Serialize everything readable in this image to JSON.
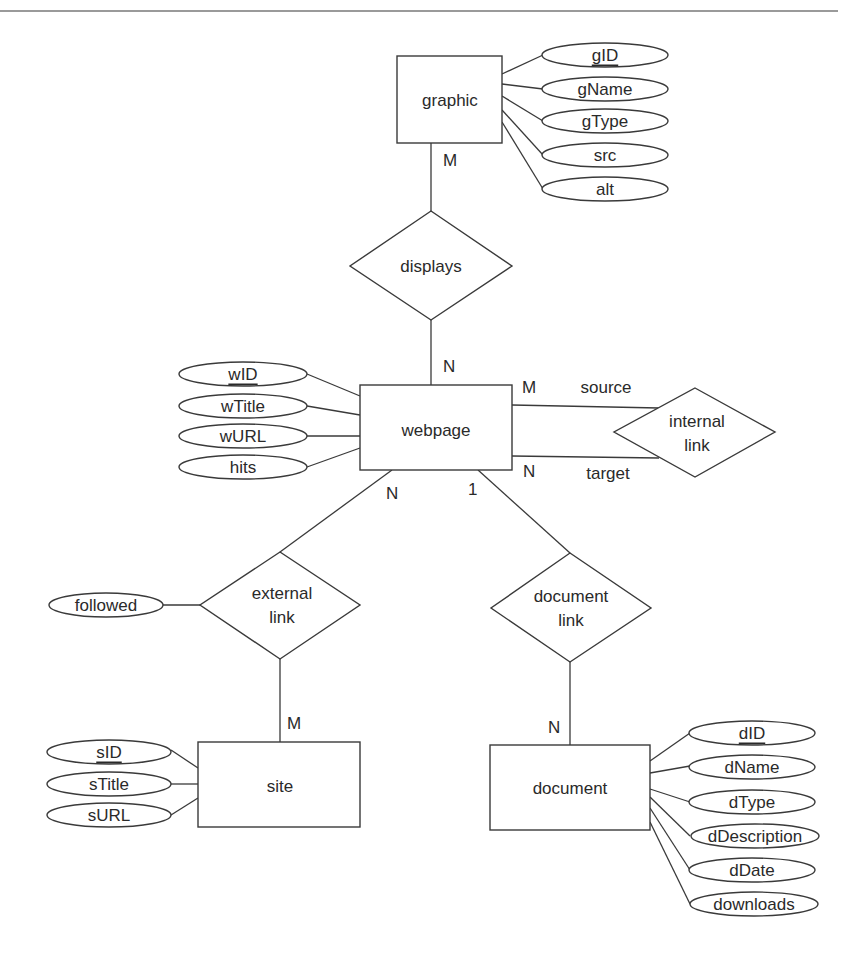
{
  "diagram": {
    "type": "entity-relationship",
    "entities": {
      "graphic": {
        "label": "graphic",
        "attributes": [
          {
            "name": "gID",
            "key": true
          },
          {
            "name": "gName",
            "key": false
          },
          {
            "name": "gType",
            "key": false
          },
          {
            "name": "src",
            "key": false
          },
          {
            "name": "alt",
            "key": false
          }
        ]
      },
      "webpage": {
        "label": "webpage",
        "attributes": [
          {
            "name": "wID",
            "key": true
          },
          {
            "name": "wTitle",
            "key": false
          },
          {
            "name": "wURL",
            "key": false
          },
          {
            "name": "hits",
            "key": false
          }
        ]
      },
      "site": {
        "label": "site",
        "attributes": [
          {
            "name": "sID",
            "key": true
          },
          {
            "name": "sTitle",
            "key": false
          },
          {
            "name": "sURL",
            "key": false
          }
        ]
      },
      "document": {
        "label": "document",
        "attributes": [
          {
            "name": "dID",
            "key": true
          },
          {
            "name": "dName",
            "key": false
          },
          {
            "name": "dType",
            "key": false
          },
          {
            "name": "dDescription",
            "key": false
          },
          {
            "name": "dDate",
            "key": false
          },
          {
            "name": "downloads",
            "key": false
          }
        ]
      }
    },
    "relationships": {
      "displays": {
        "label": "displays",
        "cardinality": {
          "graphic": "M",
          "webpage": "N"
        }
      },
      "internal_link": {
        "label_line1": "internal",
        "label_line2": "link",
        "roles": {
          "source": "source",
          "target": "target"
        },
        "cardinality": {
          "source": "M",
          "target": "N"
        }
      },
      "external_link": {
        "label_line1": "external",
        "label_line2": "link",
        "attributes": [
          {
            "name": "followed",
            "key": false
          }
        ],
        "cardinality": {
          "webpage": "N",
          "site": "M"
        }
      },
      "document_link": {
        "label_line1": "document",
        "label_line2": "link",
        "cardinality": {
          "webpage": "1",
          "document": "N"
        }
      }
    }
  },
  "colors": {
    "stroke": "#3a3a3a",
    "text": "#2a2a2a",
    "background": "#ffffff",
    "top_rule": "#9a9a9a"
  }
}
